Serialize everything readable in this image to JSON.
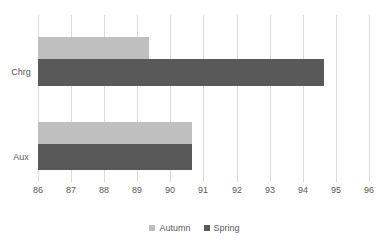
{
  "chart_data": {
    "type": "bar",
    "orientation": "horizontal",
    "title": "",
    "xlabel": "",
    "ylabel": "",
    "categories": [
      "Chrg",
      "Aux"
    ],
    "series": [
      {
        "name": "Autumn",
        "color": "#bfbfbf",
        "values": [
          89.35,
          90.65
        ]
      },
      {
        "name": "Spring",
        "color": "#595959",
        "values": [
          94.65,
          90.65
        ]
      }
    ],
    "xlim": [
      86,
      96
    ],
    "xticks": [
      86,
      87,
      88,
      89,
      90,
      91,
      92,
      93,
      94,
      95,
      96
    ],
    "xtick_labels": [
      "86",
      "87",
      "88",
      "89",
      "90",
      "91",
      "92",
      "93",
      "94",
      "95",
      "96"
    ],
    "grid": true,
    "grid_axis": "x",
    "grid_color": "#d9d9d9",
    "legend": true,
    "legend_position": "bottom",
    "legend_entries": [
      "Autumn",
      "Spring"
    ],
    "background_color": "#ffffff",
    "text_color": "#595959"
  }
}
